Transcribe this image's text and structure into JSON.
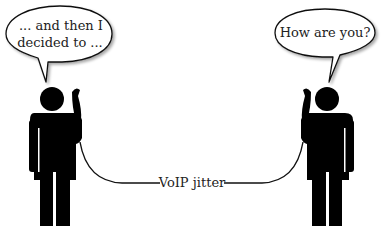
{
  "diagram": {
    "left_speaker": {
      "speech": [
        "... and then I",
        "decided to ..."
      ],
      "role": "person-on-phone"
    },
    "right_speaker": {
      "speech": [
        "How are you?"
      ],
      "role": "person-on-phone"
    },
    "connection_label": "VoIP jitter",
    "colors": {
      "figure": "#000000",
      "bubble_fill": "#ffffff",
      "bubble_stroke": "#111111",
      "text": "#222222",
      "background": "#ffffff"
    }
  }
}
